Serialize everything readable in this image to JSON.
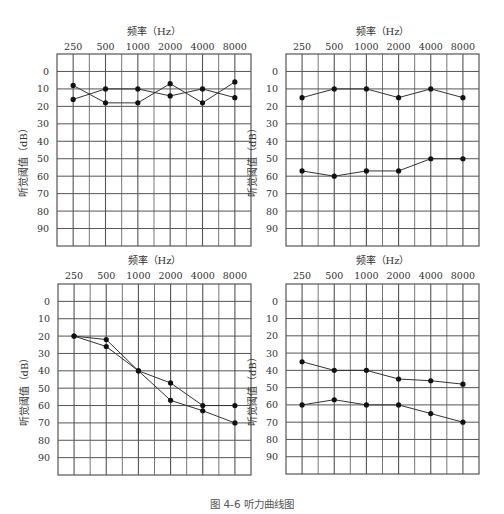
{
  "figure": {
    "caption": "图 4-6   听力曲线图"
  },
  "axis": {
    "x_title": "频率（Hz）",
    "y_title": "听觉阈值（dB）",
    "x_ticks": [
      "250",
      "500",
      "1000",
      "2000",
      "4000",
      "8000"
    ],
    "y_ticks": [
      "0",
      "10",
      "20",
      "30",
      "40",
      "50",
      "60",
      "70",
      "80",
      "90"
    ]
  },
  "colors": {
    "grid": "#555555",
    "line": "#333333",
    "marker": "#111111",
    "text": "#333333"
  },
  "chart_data": [
    {
      "type": "line",
      "position": "top-left",
      "title": "",
      "xlabel": "频率（Hz）",
      "ylabel": "听觉阈值（dB）",
      "categories": [
        "250",
        "500",
        "1000",
        "2000",
        "4000",
        "8000"
      ],
      "ylim": [
        -10,
        100
      ],
      "y_inverted": true,
      "grid": true,
      "series": [
        {
          "name": "A",
          "values": [
            8,
            18,
            18,
            7,
            18,
            6
          ]
        },
        {
          "name": "B",
          "values": [
            16,
            10,
            10,
            14,
            10,
            15
          ]
        }
      ]
    },
    {
      "type": "line",
      "position": "top-right",
      "title": "",
      "xlabel": "频率（Hz）",
      "ylabel": "听觉阈值（dB）",
      "categories": [
        "250",
        "500",
        "1000",
        "2000",
        "4000",
        "8000"
      ],
      "ylim": [
        -10,
        100
      ],
      "y_inverted": true,
      "grid": true,
      "series": [
        {
          "name": "A",
          "values": [
            15,
            10,
            10,
            15,
            10,
            15
          ]
        },
        {
          "name": "B",
          "values": [
            57,
            60,
            57,
            57,
            50,
            50
          ]
        }
      ]
    },
    {
      "type": "line",
      "position": "bottom-left",
      "title": "",
      "xlabel": "频率（Hz）",
      "ylabel": "听觉阈值（dB）",
      "categories": [
        "250",
        "500",
        "1000",
        "2000",
        "4000",
        "8000"
      ],
      "ylim": [
        -10,
        100
      ],
      "y_inverted": true,
      "grid": true,
      "series": [
        {
          "name": "A",
          "values": [
            20,
            22,
            40,
            47,
            60,
            60
          ]
        },
        {
          "name": "B",
          "values": [
            20,
            26,
            40,
            57,
            63,
            70
          ]
        }
      ]
    },
    {
      "type": "line",
      "position": "bottom-right",
      "title": "",
      "xlabel": "频率（Hz）",
      "ylabel": "听觉阈值（dB）",
      "categories": [
        "250",
        "500",
        "1000",
        "2000",
        "4000",
        "8000"
      ],
      "ylim": [
        -10,
        100
      ],
      "y_inverted": true,
      "grid": true,
      "series": [
        {
          "name": "A",
          "values": [
            35,
            40,
            40,
            45,
            46,
            48
          ]
        },
        {
          "name": "B",
          "values": [
            60,
            57,
            60,
            60,
            65,
            70
          ]
        }
      ]
    }
  ]
}
